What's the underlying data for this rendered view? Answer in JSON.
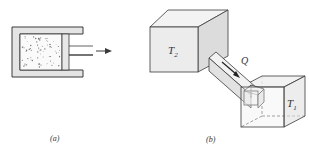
{
  "figure_a": {
    "caption": "(a)",
    "description": "Gas in a cylinder with piston being pushed outward"
  },
  "figure_b": {
    "caption": "(b)",
    "hot_reservoir_label": "T",
    "hot_reservoir_subscript": "2",
    "cold_reservoir_label": "T",
    "cold_reservoir_subscript": "1",
    "heat_flow_label": "Q"
  },
  "colors": {
    "line": "#3a3a3a",
    "wall_fill": "#e4e4e4",
    "face_fill": "#ececec",
    "top_fill": "#f3f3f3",
    "side_fill": "#dcdcdc"
  }
}
